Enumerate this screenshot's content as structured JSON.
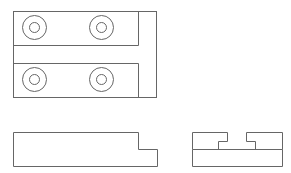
{
  "drawing": {
    "type": "orthographic-projection",
    "line_color": "#666666",
    "background": "#ffffff",
    "views": [
      {
        "name": "top-view",
        "outline": {
          "x": 13,
          "y": 11,
          "w": 143,
          "h": 86
        },
        "inner_vertical_x": 138,
        "slot_top_y": 45,
        "slot_bottom_y": 63,
        "holes": [
          {
            "cx": 34,
            "cy": 27,
            "r_outer": 12,
            "r_inner": 5
          },
          {
            "cx": 101,
            "cy": 27,
            "r_outer": 12,
            "r_inner": 5
          },
          {
            "cx": 34,
            "cy": 79,
            "r_outer": 12,
            "r_inner": 5
          },
          {
            "cx": 101,
            "cy": 79,
            "r_outer": 12,
            "r_inner": 5
          }
        ]
      },
      {
        "name": "front-view",
        "points": "13,132 138,132 138,149 157,149 157,166 13,166"
      },
      {
        "name": "side-view",
        "outline": {
          "x": 192,
          "y": 132,
          "w": 90,
          "h": 34
        },
        "mid_line_y": 149,
        "upper_profile": "192,149 192,132 227,132 227,141 218,141 218,149",
        "upper_profile_right": "282,149 282,132 246,132 246,141 255,141 255,149"
      }
    ]
  }
}
